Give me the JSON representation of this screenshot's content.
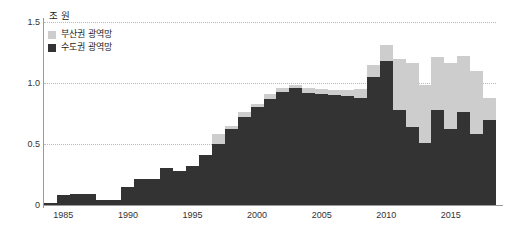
{
  "chart_data": {
    "type": "bar",
    "stacked": true,
    "title": "",
    "subtitle": "",
    "unit_label": "조 원",
    "xlabel": "",
    "ylabel": "",
    "ylim": [
      0,
      1.5
    ],
    "y_ticks": [
      0,
      0.5,
      1.0,
      1.5
    ],
    "y_tick_labels": [
      "0",
      "0.5",
      "1.0",
      "1.5"
    ],
    "x_tick_labels": [
      "1985",
      "1990",
      "1995",
      "2000",
      "2005",
      "2010",
      "2015"
    ],
    "x_tick_values": [
      1985,
      1990,
      1995,
      2000,
      2005,
      2010,
      2015
    ],
    "grid": true,
    "grid_axis": "y",
    "legend_position": "top-left",
    "categories": [
      1984,
      1985,
      1986,
      1987,
      1988,
      1989,
      1990,
      1991,
      1992,
      1993,
      1994,
      1995,
      1996,
      1997,
      1998,
      1999,
      2000,
      2001,
      2002,
      2003,
      2004,
      2005,
      2006,
      2007,
      2008,
      2009,
      2010,
      2011,
      2012,
      2013,
      2014,
      2015,
      2016,
      2017,
      2018
    ],
    "series": [
      {
        "name": "수도권 광역망",
        "color": "#333333",
        "values": [
          0.02,
          0.08,
          0.09,
          0.09,
          0.04,
          0.04,
          0.15,
          0.21,
          0.21,
          0.3,
          0.28,
          0.32,
          0.41,
          0.5,
          0.62,
          0.72,
          0.8,
          0.87,
          0.93,
          0.96,
          0.92,
          0.91,
          0.9,
          0.89,
          0.88,
          1.05,
          1.18,
          0.78,
          0.64,
          0.51,
          0.78,
          0.62,
          0.76,
          0.58,
          0.7
        ]
      },
      {
        "name": "부산권 광역망",
        "color": "#cdcdcd",
        "values": [
          0.0,
          0.0,
          0.0,
          0.0,
          0.0,
          0.0,
          0.0,
          0.0,
          0.0,
          0.0,
          0.0,
          0.0,
          0.0,
          0.08,
          0.03,
          0.04,
          0.03,
          0.04,
          0.03,
          0.02,
          0.04,
          0.04,
          0.04,
          0.05,
          0.07,
          0.1,
          0.13,
          0.42,
          0.52,
          0.47,
          0.43,
          0.54,
          0.46,
          0.52,
          0.18
        ]
      }
    ],
    "colors": {
      "busan": "#cdcdcd",
      "sudogwon": "#333333",
      "axis": "#9a9a9a",
      "grid": "#b9b9b9",
      "text": "#333333",
      "background": "#ffffff"
    }
  },
  "legend": {
    "items": [
      {
        "label": "부산권 광역망",
        "color": "#cdcdcd"
      },
      {
        "label": "수도권 광역망",
        "color": "#333333"
      }
    ]
  }
}
